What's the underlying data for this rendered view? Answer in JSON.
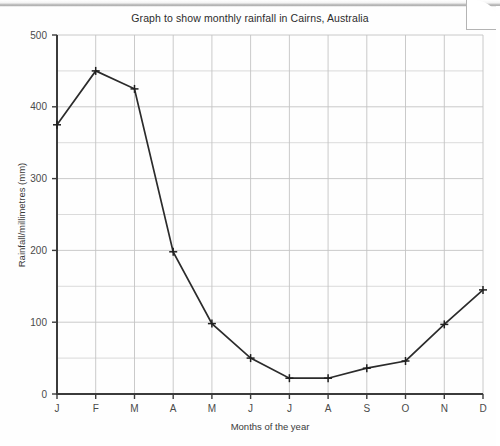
{
  "chart_data": {
    "type": "line",
    "title": "Graph to show monthly rainfall in Cairns, Australia",
    "xlabel": "Months of the year",
    "ylabel": "Rainfall/millimetres (mm)",
    "categories": [
      "J",
      "F",
      "M",
      "A",
      "M",
      "J",
      "J",
      "A",
      "S",
      "O",
      "N",
      "D"
    ],
    "values": [
      375,
      450,
      425,
      198,
      98,
      50,
      22,
      22,
      36,
      46,
      97,
      145
    ],
    "series": [
      {
        "name": "Monthly rainfall",
        "values": [
          375,
          450,
          425,
          198,
          98,
          50,
          22,
          22,
          36,
          46,
          97,
          145
        ]
      }
    ],
    "ylim": [
      0,
      500
    ],
    "ytick_labels": [
      "0",
      "100",
      "200",
      "300",
      "400",
      "500"
    ],
    "ytick_values": [
      0,
      100,
      200,
      300,
      400,
      500
    ],
    "y_minor_step": 50,
    "grid": true,
    "legend": "none",
    "marker": "plus",
    "line_color": "#2b2b2b",
    "grid_color": "#d2d2d2",
    "axis_color": "#3b3b3b"
  },
  "axes": {
    "y_title": "Rainfall/millimetres (mm)",
    "x_title": "Months of the year"
  }
}
